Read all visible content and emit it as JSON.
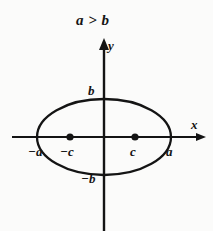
{
  "figure": {
    "title_note": "a > b",
    "background_color": "#fbfbfa",
    "ink_color": "#141414",
    "axes": {
      "x_label": "x",
      "y_label": "y",
      "origin": {
        "x": 104,
        "y": 137
      },
      "x_start": 12,
      "x_end": 206,
      "y_top": 40,
      "y_bottom": 231,
      "x_arrow": "right",
      "y_arrow": "up"
    },
    "ellipse": {
      "center": {
        "x": 104,
        "y": 137
      },
      "semi_major_px": 67,
      "semi_minor_px": 38,
      "stroke_width": 2.2
    },
    "foci": [
      {
        "name": "left-focus",
        "label": "−c",
        "x": 70,
        "y": 137
      },
      {
        "name": "right-focus",
        "label": "c",
        "x": 135,
        "y": 137
      }
    ],
    "vertex_labels": {
      "left": "−a",
      "right": "a",
      "top": "b",
      "bottom": "−b"
    }
  }
}
